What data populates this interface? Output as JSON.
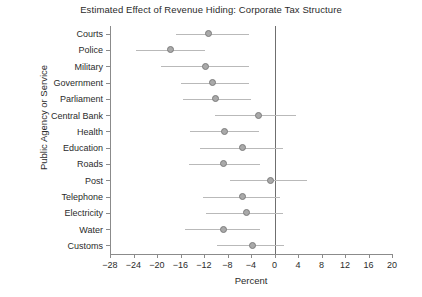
{
  "chart_data": {
    "type": "scatter",
    "title": "Estimated Effect of Revenue Hiding: Corporate Tax Structure",
    "xlabel": "Percent",
    "ylabel": "Public Agency or Service",
    "xlim": [
      -28,
      20
    ],
    "xticks": [
      -28,
      -24,
      -20,
      -16,
      -12,
      -8,
      -4,
      0,
      4,
      8,
      12,
      16,
      20
    ],
    "xtick_labels": [
      "-28",
      "-24",
      "-20",
      "-16",
      "-12",
      "-8",
      "-4",
      "0",
      "4",
      "8",
      "12",
      "16",
      "20"
    ],
    "grid": false,
    "legend": "none",
    "reference_line": 0,
    "marker_color": "#a9a9a9",
    "marker_edge_color": "#7d7d7d",
    "ci_color": "#b9b9b9",
    "axis_color": "#8b8b8b",
    "categories": [
      "Courts",
      "Police",
      "Military",
      "Government",
      "Parliament",
      "Central Bank",
      "Health",
      "Education",
      "Roads",
      "Post",
      "Telephone",
      "Electricity",
      "Water",
      "Customs"
    ],
    "values": [
      -11.3,
      -17.7,
      -11.8,
      -10.6,
      -10.1,
      -2.7,
      -8.5,
      -5.5,
      -8.7,
      -0.7,
      -5.5,
      -4.8,
      -8.7,
      -3.7
    ],
    "ci_low": [
      -16.7,
      -23.5,
      -19.4,
      -16.0,
      -15.5,
      -10.2,
      -14.4,
      -12.6,
      -14.6,
      -7.5,
      -12.1,
      -11.6,
      -15.3,
      -9.8
    ],
    "ci_high": [
      -4.4,
      -11.8,
      -4.4,
      -4.4,
      -4.0,
      3.6,
      -2.7,
      1.4,
      -2.5,
      5.6,
      1.0,
      1.4,
      -2.4,
      1.6
    ]
  }
}
